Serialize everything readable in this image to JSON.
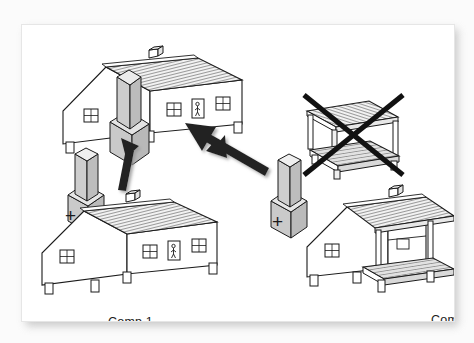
{
  "figure": {
    "background_color": "#ffffff",
    "mat_color": "#fbfbfb",
    "ink_color": "#1b1b1b",
    "block_fill": "#d7d7d7",
    "roof_fill": "#efefef",
    "deck_fill": "#dcdcdc"
  },
  "labels": {
    "comp1": "Comp 1",
    "comp2": "Comp 2",
    "plus_left": "+",
    "plus_right": "+"
  },
  "objects": [
    {
      "id": "result-house",
      "name": "combined-house-with-tower",
      "description": "Comp 1 house with gray tower block attached in front",
      "valid": true
    },
    {
      "id": "tower-left",
      "name": "gray-tower-block-left",
      "description": "Gray stacked block: tall narrow box on wider base box",
      "valid": true
    },
    {
      "id": "tower-right",
      "name": "gray-tower-block-right",
      "description": "Gray stacked block: tall narrow box on wider base box",
      "valid": true
    },
    {
      "id": "comp1-house",
      "name": "comp1-house",
      "description": "House on stilts with corrugated roof, chimney, two windows and a door",
      "valid": true
    },
    {
      "id": "comp2-house",
      "name": "comp2-house",
      "description": "House on stilts with corrugated roof extended over an open veranda deck",
      "valid": true
    },
    {
      "id": "crossed-porch",
      "name": "crossed-out-porch-structure",
      "description": "Open porch roof and deck platform on posts, struck out with a black X",
      "valid": false
    }
  ],
  "arrows": [
    {
      "id": "arrow-up",
      "name": "arrow-up-from-comp1",
      "direction": "up",
      "meaning": "Comp 1 plus tower yields combined house"
    },
    {
      "id": "arrow-diagonal",
      "name": "arrow-up-left-from-comp2",
      "direction": "up-left",
      "meaning": "Comp 2 plus tower also yields combined house"
    }
  ]
}
